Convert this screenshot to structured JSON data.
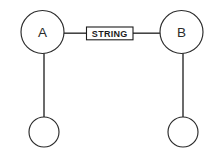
{
  "diagram": {
    "background_color": "#ffffff",
    "stroke_color": "#2b2b2b",
    "nodes": [
      {
        "id": "node-a",
        "label": "A",
        "shape": "circle",
        "cx": 42.5,
        "cy": 32,
        "r": 21.5
      },
      {
        "id": "node-b",
        "label": "B",
        "shape": "circle",
        "cx": 181.5,
        "cy": 32,
        "r": 21.5
      },
      {
        "id": "leaf-left",
        "label": "",
        "shape": "circle",
        "cx": 44,
        "cy": 132,
        "r": 15
      },
      {
        "id": "leaf-right",
        "label": "",
        "shape": "circle",
        "cx": 183,
        "cy": 132,
        "r": 15
      }
    ],
    "edges": [
      {
        "id": "edge-a-label",
        "from": "node-a",
        "to": "edge-label",
        "orientation": "horizontal"
      },
      {
        "id": "edge-label-b",
        "from": "edge-label",
        "to": "node-b",
        "orientation": "horizontal"
      },
      {
        "id": "edge-a-leaf-left",
        "from": "node-a",
        "to": "leaf-left",
        "orientation": "vertical"
      },
      {
        "id": "edge-b-leaf-right",
        "from": "node-b",
        "to": "leaf-right",
        "orientation": "vertical"
      }
    ],
    "edge_label": {
      "id": "edge-label",
      "text": "STRING",
      "x": 86,
      "y": 27,
      "width": 47,
      "height": 13
    }
  }
}
